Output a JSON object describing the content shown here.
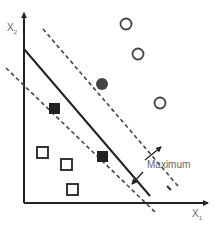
{
  "diagram": {
    "type": "svm-maximum-margin",
    "x_axis_label": "X",
    "x_axis_sub": "1",
    "y_axis_label": "X",
    "y_axis_sub": "2",
    "margin_label": "Maximum",
    "colors": {
      "axis": "#222222",
      "line": "#222222",
      "marker": "#333333",
      "label": "#666666"
    },
    "classes": [
      {
        "name": "circles",
        "points_open": [
          [
            126,
            24
          ],
          [
            137,
            54
          ],
          [
            160,
            103
          ]
        ],
        "points_support": [
          [
            102,
            85
          ]
        ]
      },
      {
        "name": "squares",
        "points_open": [
          [
            42,
            153
          ],
          [
            66,
            165
          ],
          [
            73,
            190
          ]
        ],
        "points_support": [
          [
            54,
            108
          ],
          [
            102,
            157
          ]
        ]
      }
    ]
  }
}
